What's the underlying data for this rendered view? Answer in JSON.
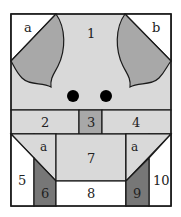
{
  "diagram": {
    "colors": {
      "light_gray": "#d9d9d9",
      "mid_gray": "#a8a8a8",
      "dark_gray": "#777777",
      "white": "#ffffff",
      "outline": "#1a1a1a",
      "eye": "#000000"
    },
    "labels": {
      "piece_1": "1",
      "corner_left_top": "a",
      "corner_right_top": "b",
      "piece_2": "2",
      "piece_3": "3",
      "piece_4": "4",
      "lower_left_a": "a",
      "lower_right_a": "a",
      "piece_5": "5",
      "piece_6": "6",
      "piece_7": "7",
      "piece_8": "8",
      "piece_9": "9",
      "piece_10": "10"
    }
  }
}
